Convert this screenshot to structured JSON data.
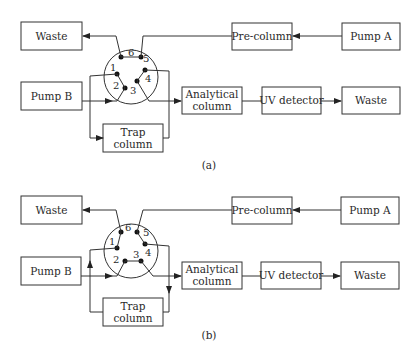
{
  "diagrams": [
    {
      "caption": "(a)",
      "boxes": {
        "waste_top": "Waste",
        "pre_column": "Pre-column",
        "pump_a": "Pump A",
        "pump_b": "Pump B",
        "analytical_line1": "Analytical",
        "analytical_line2": "column",
        "uv_detector": "UV detector",
        "waste_right": "Waste",
        "trap_line1": "Trap",
        "trap_line2": "column"
      },
      "valve_ports": [
        "1",
        "2",
        "3",
        "4",
        "5",
        "6"
      ],
      "valve_connections": [
        "6-5",
        "1-2",
        "3-4"
      ]
    },
    {
      "caption": "(b)",
      "boxes": {
        "waste_top": "Waste",
        "pre_column": "Pre-column",
        "pump_a": "Pump A",
        "pump_b": "Pump B",
        "analytical_line1": "Analytical",
        "analytical_line2": "column",
        "uv_detector": "UV detector",
        "waste_right": "Waste",
        "trap_line1": "Trap",
        "trap_line2": "column"
      },
      "valve_ports": [
        "1",
        "2",
        "3",
        "4",
        "5",
        "6"
      ],
      "valve_connections": [
        "6-1",
        "2-3",
        "4-5"
      ]
    }
  ]
}
